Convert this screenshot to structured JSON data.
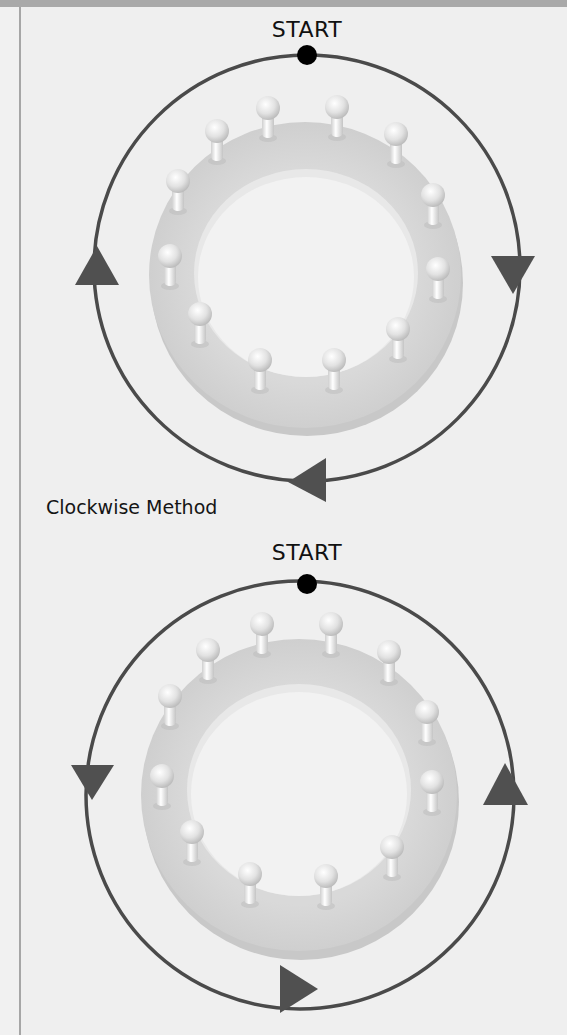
{
  "colors": {
    "background": "#efefef",
    "top_band": "#a9a9a9",
    "orbit_line": "#4a4a4a",
    "arrow": "#505050",
    "start_dot": "#000000",
    "ring": "#d2d2d2",
    "peg": "#f4f4f4"
  },
  "diagrams": [
    {
      "start_label": "START",
      "direction": "counterclockwise",
      "peg_count": 12,
      "arrows": [
        "left-up",
        "right-down",
        "bottom-left"
      ]
    },
    {
      "caption": "Clockwise Method",
      "start_label": "START",
      "direction": "clockwise",
      "peg_count": 12,
      "arrows": [
        "left-down",
        "right-up",
        "bottom-right"
      ]
    }
  ]
}
